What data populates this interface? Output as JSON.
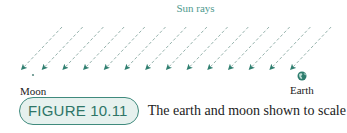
{
  "diagram": {
    "title": "Sun rays",
    "labels": {
      "moon": "Moon",
      "earth": "Earth"
    },
    "rays": {
      "count": 14,
      "color": "#2f7f70",
      "dash_color": "#8aa9a3",
      "start_x": 22,
      "spacing": 20.7,
      "tip_y": 69,
      "dx": 40,
      "dy": 42
    },
    "bodies": {
      "moon": {
        "x": 33,
        "y": 75,
        "r": 1.1,
        "color": "#5f8f86"
      },
      "earth": {
        "x": 302,
        "y": 76,
        "r": 4.5,
        "color": "#2e7d6e"
      }
    }
  },
  "caption": {
    "badge": "FIGURE 10.11",
    "text": "The earth and moon shown to scale"
  },
  "colors": {
    "accent": "#2e7567",
    "badge_bg": "#e6f1ee",
    "title": "#4e9a8e"
  }
}
